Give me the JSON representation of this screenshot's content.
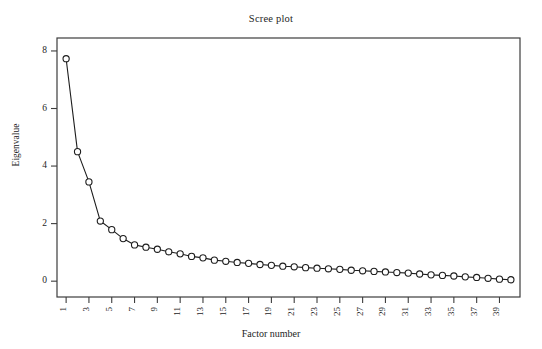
{
  "chart_data": {
    "type": "line",
    "title": "Scree plot",
    "xlabel": "Factor number",
    "ylabel": "Eigenvalue",
    "grid": false,
    "legend": "none",
    "marker": "open-circle",
    "line_color": "#1d1d1d",
    "marker_face_color": "#ffffff",
    "axis_color": "#3d3d3d",
    "xlim": [
      0.2,
      40.8
    ],
    "ylim": [
      -0.55,
      8.45
    ],
    "yticks": [
      0,
      2,
      4,
      6,
      8
    ],
    "ytick_labels": [
      "0",
      "2",
      "4",
      "6",
      "8"
    ],
    "xticks": [
      1,
      3,
      5,
      7,
      9,
      11,
      13,
      15,
      17,
      19,
      21,
      23,
      25,
      27,
      29,
      31,
      33,
      35,
      37,
      39
    ],
    "xtick_labels": [
      "1",
      "3",
      "5",
      "7",
      "9",
      "11",
      "13",
      "15",
      "17",
      "19",
      "21",
      "23",
      "25",
      "27",
      "29",
      "31",
      "33",
      "35",
      "37",
      "39"
    ],
    "xtick_rotation": 90,
    "x": [
      1,
      2,
      3,
      4,
      5,
      6,
      7,
      8,
      9,
      10,
      11,
      12,
      13,
      14,
      15,
      16,
      17,
      18,
      19,
      20,
      21,
      22,
      23,
      24,
      25,
      26,
      27,
      28,
      29,
      30,
      31,
      32,
      33,
      34,
      35,
      36,
      37,
      38,
      39,
      40
    ],
    "values": [
      7.73,
      4.5,
      3.45,
      2.09,
      1.79,
      1.48,
      1.26,
      1.18,
      1.11,
      1.02,
      0.95,
      0.86,
      0.81,
      0.73,
      0.69,
      0.65,
      0.62,
      0.58,
      0.55,
      0.52,
      0.5,
      0.47,
      0.45,
      0.43,
      0.41,
      0.38,
      0.36,
      0.34,
      0.32,
      0.3,
      0.28,
      0.25,
      0.22,
      0.2,
      0.18,
      0.15,
      0.13,
      0.1,
      0.07,
      0.05
    ]
  }
}
